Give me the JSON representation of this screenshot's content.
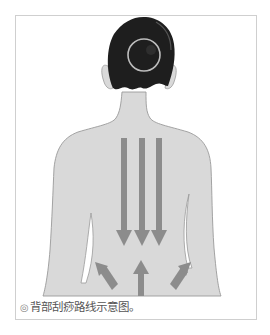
{
  "figure": {
    "colors": {
      "skin": "#d9d9d9",
      "outline": "#9a9a9a",
      "hair": "#1e1e1e",
      "circle": "#bdbdbd",
      "arrows": "#8c8c8c",
      "frame": "#cfcfcf"
    },
    "markers": {
      "head_circle": "scalp-circle-marker",
      "down_arrows": 3,
      "up_arrows": 3
    }
  },
  "caption": {
    "bullet": "◎",
    "text": "背部刮痧路线示意图。"
  }
}
